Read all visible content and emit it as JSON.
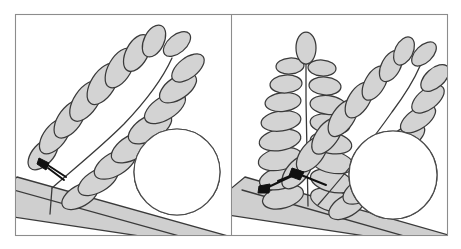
{
  "figure": {
    "type": "botanical-line-drawing",
    "title": "",
    "subtitle": "",
    "panel_count": 2,
    "background_color": "#ffffff",
    "leaf_fill_color": "#d3d3d3",
    "outline_color": "#3a3a3a",
    "thorn_color": "#111111",
    "branch_fill_color": "#cfcfcf",
    "frame_color": "#8c8c8c"
  },
  "panels": [
    {
      "id": "panel-left",
      "label": "",
      "leaf_type": "pinnately compound leaf",
      "leaf_count": 1,
      "leaflet_count": 17,
      "orientation": "ascending to upper right",
      "stem_description": "single thick diagonal branch running lower-left to lower-right",
      "thorn_description": "one short dark prickle at the leaf base where petiole meets branch",
      "inset": {
        "id": "inset-left",
        "shape": "circle",
        "magnified_subject": "short stubby prickle with two small leaflets at node",
        "prickle_shape": "short, broad, blunt spur",
        "leaflet_count": 2
      }
    },
    {
      "id": "panel-right",
      "label": "",
      "leaf_type": "pinnately compound leaves",
      "leaf_count": 2,
      "leaflet_count": 34,
      "orientation": "one vertical, one ascending to upper right",
      "stem_description": "single thick diagonal branch running lower-left to lower-right",
      "thorn_description": "two dark prickles at the paired leaf bases where petioles meet branch",
      "inset": {
        "id": "inset-right",
        "shape": "circle",
        "magnified_subject": "slender hooked prickle pair with leaflets at node",
        "prickle_shape": "elongated, narrow, hooked spine",
        "leaflet_count": 3
      }
    }
  ],
  "frame": {
    "outer_border": true,
    "divider": true,
    "divider_orientation": "vertical",
    "divider_position_px": 231
  }
}
